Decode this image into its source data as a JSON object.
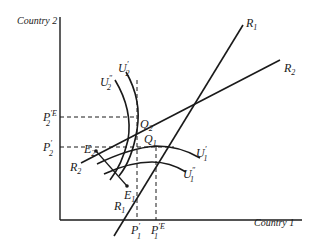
{
  "diagram": {
    "type": "reaction-function / indifference-curve diagram",
    "axes": {
      "y_label": "Country 2",
      "x_label": "Country 1"
    },
    "reaction_curves": [
      {
        "id": "R1",
        "name": "R",
        "sub": "1"
      },
      {
        "id": "R2",
        "name": "R",
        "sub": "2"
      }
    ],
    "indifference_curves": [
      {
        "id": "U2p",
        "name": "U",
        "sub": "2",
        "sup": "′"
      },
      {
        "id": "U2pp",
        "name": "U",
        "sub": "2",
        "sup": "″"
      },
      {
        "id": "U1p",
        "name": "U",
        "sub": "1",
        "sup": "′"
      },
      {
        "id": "U1pp",
        "name": "U",
        "sub": "1",
        "sup": "″"
      }
    ],
    "points": [
      {
        "id": "Q2",
        "name": "Q",
        "sub": "2"
      },
      {
        "id": "Q1",
        "name": "Q",
        "sub": "1"
      },
      {
        "id": "E2",
        "name": "E",
        "sub": "2"
      },
      {
        "id": "E1",
        "name": "E",
        "sub": "1"
      }
    ],
    "y_ticks": [
      {
        "id": "P2E",
        "name": "P",
        "sub": "2",
        "sup": "′E"
      },
      {
        "id": "P2",
        "name": "P",
        "sub": "2",
        "sup": "′"
      }
    ],
    "x_ticks": [
      {
        "id": "P1",
        "name": "P",
        "sub": "1",
        "sup": "′"
      },
      {
        "id": "P1E",
        "name": "P",
        "sub": "1",
        "sup": "′E"
      }
    ]
  }
}
